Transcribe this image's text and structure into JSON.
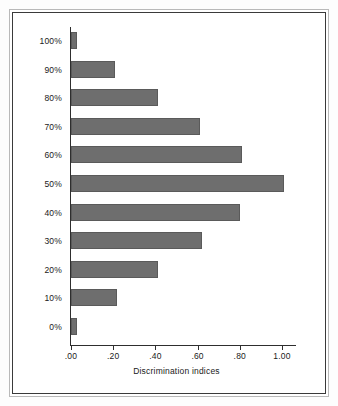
{
  "chart_data": {
    "type": "bar",
    "orientation": "horizontal",
    "title": "",
    "xlabel": "Discrimination indices",
    "ylabel": "Difficulty levels",
    "categories": [
      "100%",
      "90%",
      "80%",
      "70%",
      "60%",
      "50%",
      "40%",
      "30%",
      "20%",
      "10%",
      "0%"
    ],
    "values": [
      0.03,
      0.21,
      0.41,
      0.61,
      0.81,
      1.01,
      0.8,
      0.62,
      0.41,
      0.22,
      0.03
    ],
    "series": [
      {
        "name": "Discrimination index",
        "values": [
          0.03,
          0.21,
          0.41,
          0.61,
          0.81,
          1.01,
          0.8,
          0.62,
          0.41,
          0.22,
          0.03
        ]
      }
    ],
    "xlim": [
      0.0,
      1.07
    ],
    "ylim": null,
    "xticks": [
      0.0,
      0.2,
      0.4,
      0.6,
      0.8,
      1.0
    ],
    "xtick_labels": [
      ".00",
      ".20",
      ".40",
      ".60",
      ".80",
      "1.00"
    ],
    "grid": false,
    "legend": null,
    "bar_color": "#6e6e6e",
    "axis_color": "#2e2e2e",
    "background": "#ffffff"
  },
  "figure": {
    "frame_color": "#3a3a3a",
    "outer_frame_color": "#b9b9b9"
  }
}
